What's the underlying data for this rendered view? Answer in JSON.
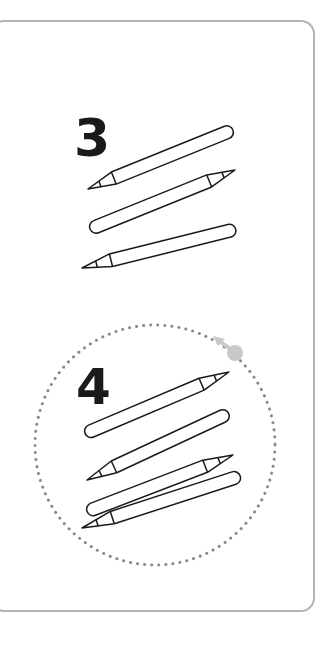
{
  "card": {
    "border_color": "#b4b4b4"
  },
  "groups": [
    {
      "number": "3",
      "pencil_count": 3,
      "rotation_hint": false
    },
    {
      "number": "4",
      "pencil_count": 4,
      "rotation_hint": true
    }
  ],
  "icons": {
    "rotate": "rotate-arrow-icon"
  },
  "colors": {
    "ink": "#1a1a1a",
    "dots": "#8a8a8a",
    "rotate_handle": "#c8c8c8"
  }
}
